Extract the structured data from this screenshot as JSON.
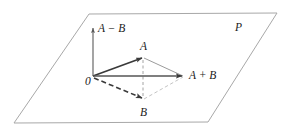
{
  "figure": {
    "plane_label": "P",
    "origin_label": "0",
    "labels": {
      "a_minus_b": "A − B",
      "a": "A",
      "a_plus_b": "A + B",
      "b": "B"
    },
    "colors": {
      "plane_outline": "#a8a8a8",
      "vector_bold": "#3a3a3a",
      "vector_thin": "#8a8a8a",
      "dashed_light": "#b5b5b5",
      "text": "#1a1a1a",
      "background": "#ffffff"
    },
    "geometry": {
      "plane_corners": [
        [
          89,
          14
        ],
        [
          277,
          13
        ],
        [
          208,
          122
        ],
        [
          14,
          123
        ]
      ],
      "origin": [
        93,
        76
      ],
      "point_a": [
        143,
        57
      ],
      "point_b": [
        143,
        100
      ],
      "point_a_plus_b": [
        183,
        76
      ],
      "a_minus_b_tip": [
        93,
        27
      ]
    },
    "elements": [
      "plane-parallelogram",
      "vector-a-minus-b",
      "vector-oa",
      "vector-ob-dashed",
      "vector-oapb",
      "edge-a-to-apb",
      "edge-b-to-apb-dashed",
      "diagonal-a-to-b-dashed"
    ]
  }
}
